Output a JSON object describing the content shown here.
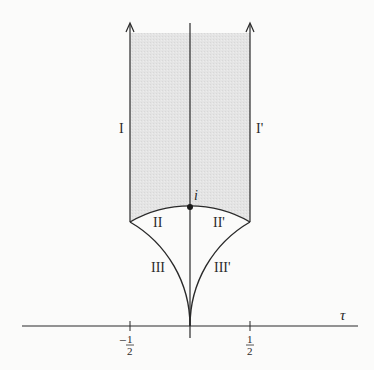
{
  "figure": {
    "colors": {
      "background": "#fbfbfa",
      "shading": "#e3e3e3",
      "ink": "#2a2a2a"
    },
    "axis": {
      "label": "τ",
      "ticks": [
        {
          "position": -0.5,
          "sign": "−",
          "numerator": "1",
          "denominator": "2"
        },
        {
          "position": 0.5,
          "sign": "",
          "numerator": "1",
          "denominator": "2"
        }
      ]
    },
    "point": {
      "label": "i"
    },
    "regions": {
      "I": "I",
      "I_prime": "I'",
      "II": "II",
      "II_prime": "II'",
      "III": "III",
      "III_prime": "III'"
    }
  }
}
